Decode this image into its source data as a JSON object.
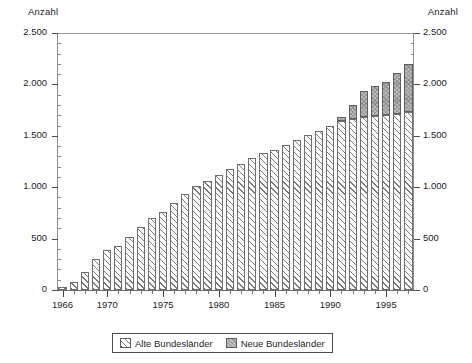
{
  "chart_data": {
    "type": "bar",
    "subtype": "stacked-vertical",
    "title": "",
    "xlabel": "",
    "ylabel": "Anzahl",
    "ylabel_right": "Anzahl",
    "ylim": [
      0,
      2500
    ],
    "ytick_values": [
      0,
      500,
      1000,
      1500,
      2000,
      2500
    ],
    "ytick_labels": [
      "0",
      "500",
      "1.000",
      "1.500",
      "2.000",
      "2.500"
    ],
    "ytick_minor_step": 100,
    "grid": false,
    "legend_position": "bottom-center",
    "xlim": [
      1965.4,
      1997.6
    ],
    "xtick_major_values": [
      1966,
      1970,
      1975,
      1980,
      1985,
      1990,
      1995
    ],
    "xtick_major_labels": [
      "1966",
      "1970",
      "1975",
      "1980",
      "1985",
      "1990",
      "1995"
    ],
    "categories": [
      "1966",
      "1967",
      "1968",
      "1969",
      "1970",
      "1971",
      "1972",
      "1973",
      "1974",
      "1975",
      "1976",
      "1977",
      "1978",
      "1979",
      "1980",
      "1981",
      "1982",
      "1983",
      "1984",
      "1985",
      "1986",
      "1987",
      "1988",
      "1989",
      "1990",
      "1991",
      "1992",
      "1993",
      "1994",
      "1995",
      "1996",
      "1997"
    ],
    "series": [
      {
        "name": "Alte Bundesländer",
        "color": "#ffffff",
        "pattern": "diagonal-hatch",
        "values": [
          30,
          75,
          180,
          300,
          390,
          430,
          520,
          610,
          700,
          760,
          850,
          930,
          1010,
          1060,
          1120,
          1180,
          1230,
          1280,
          1330,
          1360,
          1410,
          1460,
          1510,
          1550,
          1600,
          1640,
          1660,
          1680,
          1690,
          1700,
          1710,
          1730
        ]
      },
      {
        "name": "Neue Bundesländer",
        "color": "#b8b8b8",
        "pattern": "solid-gray",
        "values": [
          0,
          0,
          0,
          0,
          0,
          0,
          0,
          0,
          0,
          0,
          0,
          0,
          0,
          0,
          0,
          0,
          0,
          0,
          0,
          0,
          0,
          0,
          0,
          0,
          0,
          40,
          140,
          260,
          290,
          320,
          400,
          470
        ]
      }
    ],
    "totals": [
      30,
      75,
      180,
      300,
      390,
      430,
      520,
      610,
      700,
      760,
      850,
      930,
      1010,
      1060,
      1120,
      1180,
      1230,
      1280,
      1330,
      1360,
      1410,
      1460,
      1510,
      1550,
      1600,
      1680,
      1800,
      1940,
      1980,
      2020,
      2110,
      2200
    ],
    "legend": [
      {
        "label": "Alte Bundesländer",
        "swatch": "hatched"
      },
      {
        "label": "Neue Bundesländer",
        "swatch": "gray"
      }
    ]
  }
}
